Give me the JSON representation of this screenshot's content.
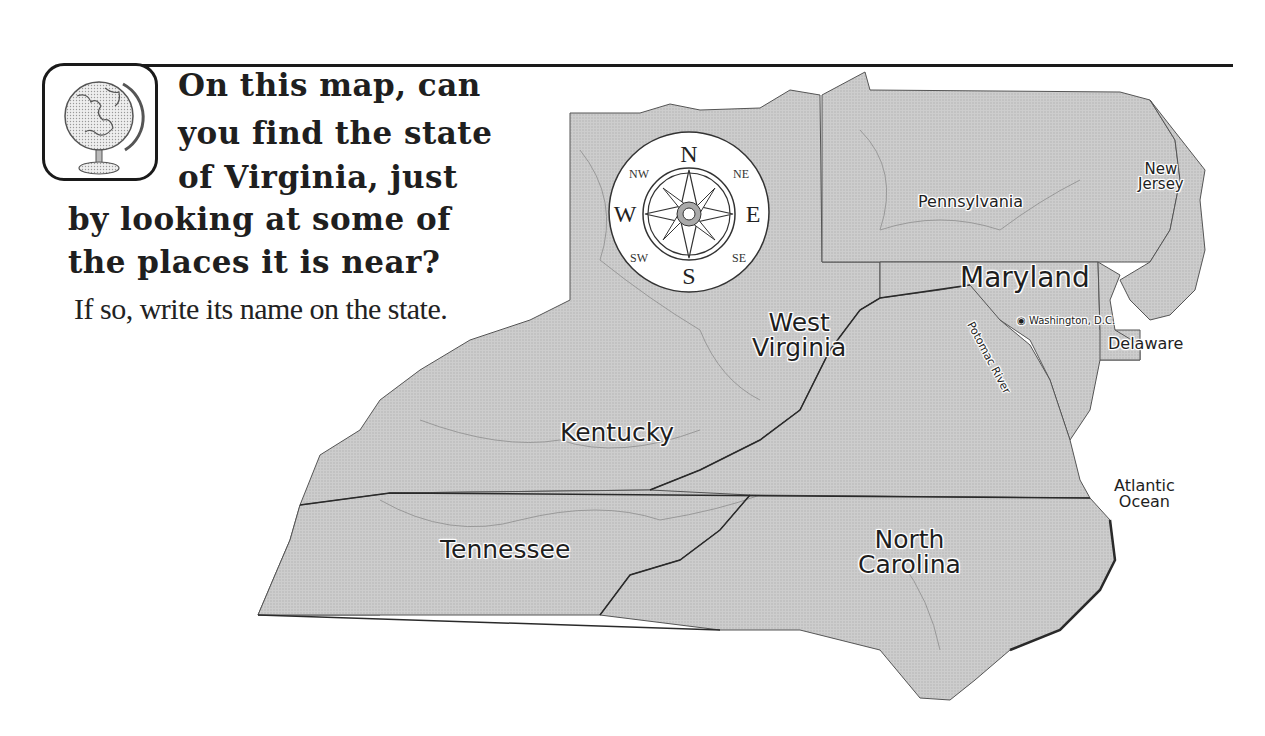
{
  "question": {
    "lines": [
      "On this map, can",
      "you find the state",
      "of Virginia, just",
      "by looking at some of",
      "the places it is near?"
    ],
    "instruction": "If so, write its name on the state."
  },
  "compass": {
    "n": "N",
    "s": "S",
    "e": "E",
    "w": "W",
    "ne": "NE",
    "nw": "NW",
    "se": "SE",
    "sw": "SW"
  },
  "map": {
    "fill_color": "#c8c8c8",
    "border_color": "#3a3a3a",
    "states": {
      "pennsylvania": "Pennsylvania",
      "new_jersey": [
        "New",
        "Jersey"
      ],
      "maryland": "Maryland",
      "delaware": "Delaware",
      "west_virginia": [
        "West",
        "Virginia"
      ],
      "kentucky": "Kentucky",
      "tennessee": "Tennessee",
      "north_carolina": [
        "North",
        "Carolina"
      ]
    },
    "features": {
      "potomac_river": "Potomac River",
      "washington_dc": "Washington, D.C.",
      "atlantic_ocean": [
        "Atlantic",
        "Ocean"
      ]
    }
  }
}
